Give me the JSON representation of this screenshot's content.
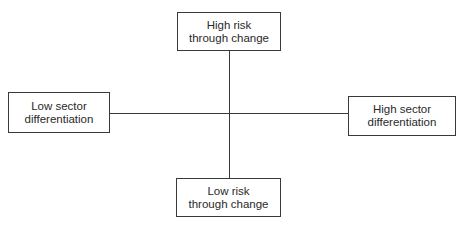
{
  "diagram": {
    "type": "quadrant-axes",
    "axes": {
      "vertical": {
        "top": {
          "line1": "High risk",
          "line2": "through change"
        },
        "bottom": {
          "line1": "Low risk",
          "line2": "through change"
        }
      },
      "horizontal": {
        "left": {
          "line1": "Low sector",
          "line2": "differentiation"
        },
        "right": {
          "line1": "High sector",
          "line2": "differentiation"
        }
      }
    },
    "colors": {
      "line": "#3a3a3a",
      "text": "#2a2a2a",
      "background": "#ffffff"
    }
  }
}
